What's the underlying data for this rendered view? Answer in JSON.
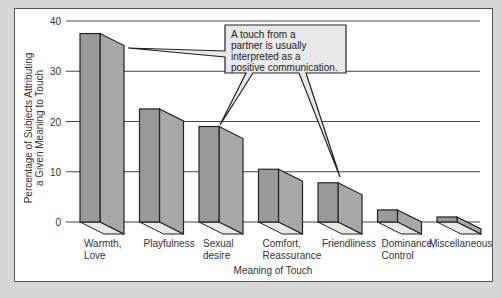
{
  "chart_data": {
    "type": "bar",
    "title": "",
    "xlabel": "Meaning of Touch",
    "ylabel": "Percentage of Subjects Attributing a Given Meaning to Touch",
    "ylabel_lines": [
      "Percentage of Subjects Attributing",
      "a Given Meaning to Touch"
    ],
    "ylim": [
      0,
      40
    ],
    "yticks": [
      0,
      10,
      20,
      30,
      40
    ],
    "grid": true,
    "style": "3d-bars",
    "categories": [
      [
        "Warmth,",
        "Love"
      ],
      [
        "Playfulness"
      ],
      [
        "Sexual",
        "desire"
      ],
      [
        "Comfort,",
        "Reassurance"
      ],
      [
        "Friendliness"
      ],
      [
        "Dominance,",
        "Control"
      ],
      [
        "Miscellaneous"
      ]
    ],
    "values": [
      37.5,
      22.5,
      19,
      10.5,
      7.8,
      2.4,
      1
    ],
    "annotation": {
      "lines": [
        "A touch from a",
        "partner is usually",
        "interpreted as a",
        "positive communication."
      ],
      "points_to": [
        "Warmth, Love",
        "Sexual desire",
        "Friendliness"
      ]
    }
  },
  "colors": {
    "bar_front": "#9a9a9a",
    "bar_side": "#a8a8a8",
    "bar_floor": "#e8e8e8",
    "callout_fill": "#e9e9e9",
    "background": "#d6d6d4"
  }
}
